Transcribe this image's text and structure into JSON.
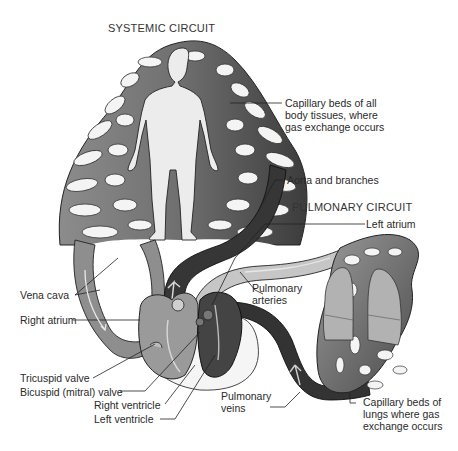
{
  "titles": {
    "systemic": "SYSTEMIC CIRCUIT",
    "pulmonary": "PULMONARY CIRCUIT"
  },
  "labels": {
    "capillary_body_1": "Capillary beds of all",
    "capillary_body_2": "body tissues, where",
    "capillary_body_3": "gas exchange occurs",
    "aorta": "Aorta and branches",
    "left_atrium": "Left atrium",
    "pulmonary_arteries_1": "Pulmonary",
    "pulmonary_arteries_2": "arteries",
    "vena_cava": "Vena cava",
    "right_atrium": "Right atrium",
    "tricuspid": "Tricuspid valve",
    "bicuspid": "Bicuspid (mitral) valve",
    "right_ventricle": "Right ventricle",
    "left_ventricle": "Left ventricle",
    "pulmonary_veins_1": "Pulmonary",
    "pulmonary_veins_2": "veins",
    "capillary_lungs_1": "Capillary beds of",
    "capillary_lungs_2": "lungs where gas",
    "capillary_lungs_3": "exchange occurs"
  },
  "colors": {
    "deoxygenated": "#8a8a8a",
    "oxygenated": "#3a3a3a",
    "capillary": "#7a7a7a",
    "body": "#ececec",
    "pulmonary_artery_light": "#c8c8c8"
  }
}
